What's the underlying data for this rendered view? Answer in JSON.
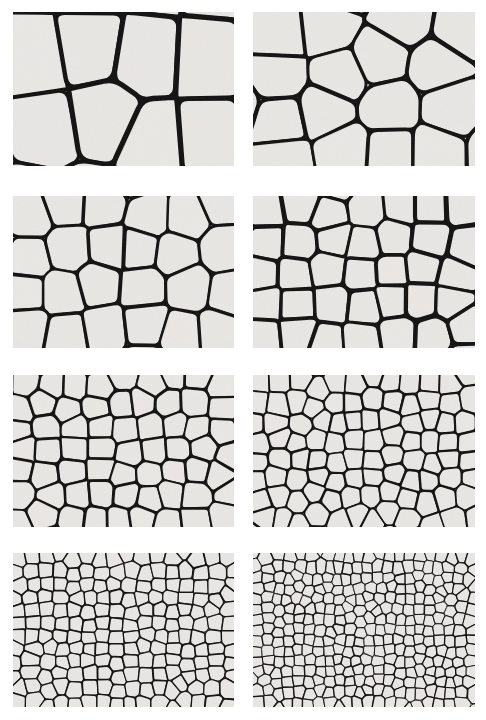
{
  "figure": {
    "background_color": "#ffffff",
    "cell_fill_color": "#e9e7e4",
    "cell_wall_color": "#111111",
    "caption": ""
  },
  "layout": {
    "width": 486,
    "height": 720,
    "rows": 4,
    "columns": 2
  },
  "chart_data": {
    "type": "image-grid",
    "xlabel": "",
    "ylabel": "",
    "categories": [
      "panel-1",
      "panel-2",
      "panel-3",
      "panel-4",
      "panel-5",
      "panel-6",
      "panel-7",
      "panel-8"
    ],
    "values": [
      9,
      14,
      26,
      38,
      60,
      92,
      185,
      330
    ],
    "series": [
      {
        "name": "approximate visible cell count",
        "values": [
          9,
          14,
          26,
          38,
          60,
          92,
          185,
          330
        ]
      },
      {
        "name": "relative mean cell size",
        "values": [
          1.0,
          0.8,
          0.59,
          0.49,
          0.39,
          0.31,
          0.22,
          0.165
        ]
      }
    ],
    "legend_position": "none",
    "grid": false
  },
  "panels": [
    {
      "id": "panel-1",
      "name": "cell-structure-panel-1",
      "row": 1,
      "column": 1,
      "x": 13,
      "y": 12,
      "width": 221,
      "height": 154,
      "cell_count": 9,
      "wall_width": 4.2,
      "seed": 101,
      "label": ""
    },
    {
      "id": "panel-2",
      "name": "cell-structure-panel-2",
      "row": 1,
      "column": 2,
      "x": 253,
      "y": 12,
      "width": 222,
      "height": 154,
      "cell_count": 14,
      "wall_width": 3.6,
      "seed": 202,
      "label": ""
    },
    {
      "id": "panel-3",
      "name": "cell-structure-panel-3",
      "row": 2,
      "column": 1,
      "x": 13,
      "y": 196,
      "width": 221,
      "height": 152,
      "cell_count": 26,
      "wall_width": 2.8,
      "seed": 303,
      "label": ""
    },
    {
      "id": "panel-4",
      "name": "cell-structure-panel-4",
      "row": 2,
      "column": 2,
      "x": 253,
      "y": 196,
      "width": 222,
      "height": 152,
      "cell_count": 38,
      "wall_width": 3.4,
      "seed": 404,
      "label": ""
    },
    {
      "id": "panel-5",
      "name": "cell-structure-panel-5",
      "row": 3,
      "column": 1,
      "x": 13,
      "y": 375,
      "width": 221,
      "height": 152,
      "cell_count": 60,
      "wall_width": 2.3,
      "seed": 505,
      "label": ""
    },
    {
      "id": "panel-6",
      "name": "cell-structure-panel-6",
      "row": 3,
      "column": 2,
      "x": 253,
      "y": 375,
      "width": 222,
      "height": 152,
      "cell_count": 92,
      "wall_width": 1.9,
      "seed": 606,
      "label": ""
    },
    {
      "id": "panel-7",
      "name": "cell-structure-panel-7",
      "row": 4,
      "column": 1,
      "x": 13,
      "y": 553,
      "width": 221,
      "height": 154,
      "cell_count": 185,
      "wall_width": 1.35,
      "seed": 707,
      "label": ""
    },
    {
      "id": "panel-8",
      "name": "cell-structure-panel-8",
      "row": 4,
      "column": 2,
      "x": 253,
      "y": 553,
      "width": 222,
      "height": 154,
      "cell_count": 330,
      "wall_width": 1.1,
      "seed": 808,
      "label": ""
    }
  ]
}
